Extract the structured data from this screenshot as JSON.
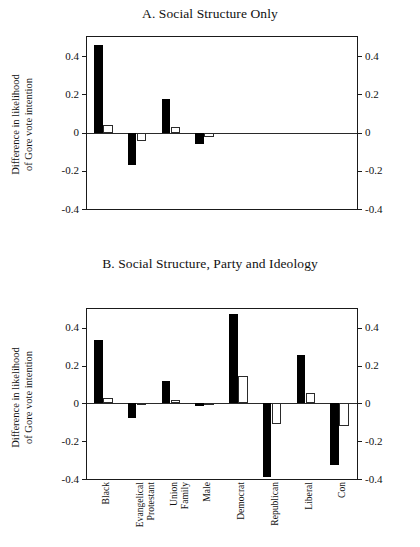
{
  "figure": {
    "y_axis_caption_line1": "Difference in likelihood",
    "y_axis_caption_line2": "of Gore vote intention"
  },
  "panels": [
    {
      "id": "A",
      "title": "A. Social Structure Only"
    },
    {
      "id": "B",
      "title": "B. Social Structure, Party and Ideology"
    }
  ],
  "axis": {
    "tick_labels": [
      "0.4",
      "0.2",
      "0",
      "-0.2",
      "-0.4"
    ],
    "tick_values": [
      0.4,
      0.2,
      0,
      -0.2,
      -0.4
    ]
  },
  "categories": [
    {
      "lines": [
        "Black"
      ]
    },
    {
      "lines": [
        "Evangelical",
        "Protestant"
      ]
    },
    {
      "lines": [
        "Union",
        "Family"
      ]
    },
    {
      "lines": [
        "Male"
      ]
    },
    {
      "lines": [
        "Democrat"
      ]
    },
    {
      "lines": [
        "Republican"
      ]
    },
    {
      "lines": [
        "Liberal"
      ]
    },
    {
      "lines": [
        "Con"
      ]
    }
  ],
  "colors": {
    "series1": "#000000",
    "series2": "#ffffff",
    "series2_edge": "#2b2b2b",
    "axis": "#1a1a1a"
  },
  "chart_data": [
    {
      "type": "bar",
      "title": "A. Social Structure Only",
      "xlabel": "",
      "ylabel": "Difference in likelihood of Gore vote intention",
      "ylim": [
        -0.4,
        0.5
      ],
      "yticks": [
        -0.4,
        -0.2,
        0,
        0.2,
        0.4
      ],
      "grid": false,
      "legend": "none",
      "categories": [
        "Black",
        "Evangelical Protestant",
        "Union Family",
        "Male",
        "Democrat",
        "Republican",
        "Liberal",
        "Con"
      ],
      "series": [
        {
          "name": "Black bar",
          "values": [
            0.458,
            -0.168,
            0.176,
            -0.062,
            null,
            null,
            null,
            null
          ]
        },
        {
          "name": "White bar",
          "values": [
            0.042,
            -0.046,
            0.029,
            -0.024,
            null,
            null,
            null,
            null
          ]
        }
      ]
    },
    {
      "type": "bar",
      "title": "B. Social Structure, Party and Ideology",
      "xlabel": "",
      "ylabel": "Difference in likelihood of Gore vote intention",
      "ylim": [
        -0.4,
        0.5
      ],
      "yticks": [
        -0.4,
        -0.2,
        0,
        0.2,
        0.4
      ],
      "grid": false,
      "legend": "none",
      "categories": [
        "Black",
        "Evangelical Protestant",
        "Union Family",
        "Male",
        "Democrat",
        "Republican",
        "Liberal",
        "Con"
      ],
      "series": [
        {
          "name": "Black bar",
          "values": [
            0.337,
            -0.077,
            0.118,
            -0.012,
            0.476,
            -0.392,
            0.257,
            -0.328
          ]
        },
        {
          "name": "White bar",
          "values": [
            0.027,
            -0.01,
            0.019,
            -0.004,
            0.147,
            -0.11,
            0.057,
            -0.118
          ]
        }
      ]
    }
  ]
}
